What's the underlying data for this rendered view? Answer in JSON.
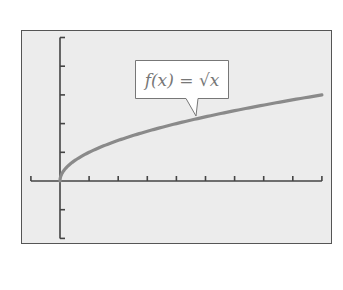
{
  "chart_data": {
    "type": "line",
    "title": "",
    "xlabel": "",
    "ylabel": "",
    "xlim": [
      -1,
      9
    ],
    "ylim": [
      -2,
      5
    ],
    "x_ticks": [
      -1,
      0,
      1,
      2,
      3,
      4,
      5,
      6,
      7,
      8,
      9
    ],
    "y_ticks": [
      -2,
      -1,
      0,
      1,
      2,
      3,
      4,
      5
    ],
    "tick_labels_shown": false,
    "grid": false,
    "legend": null,
    "series": [
      {
        "name": "f(x) = √x",
        "x": [
          0,
          0.25,
          0.5,
          1,
          2,
          3,
          4,
          5,
          6,
          7,
          8,
          9
        ],
        "y": [
          0,
          0.5,
          0.707,
          1,
          1.414,
          1.732,
          2,
          2.236,
          2.449,
          2.646,
          2.828,
          3
        ],
        "color": "#8a8a8a"
      }
    ],
    "annotations": [
      {
        "text": "f(x) = √x",
        "type": "callout",
        "points_to": [
          4.7,
          2.17
        ]
      }
    ]
  },
  "colors": {
    "background": "#ececec",
    "axis": "#444444",
    "curve": "#8a8a8a",
    "frame": "#555555"
  },
  "callout": {
    "label": "f(x) = √x"
  }
}
